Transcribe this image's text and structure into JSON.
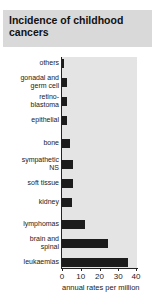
{
  "chart_data": {
    "type": "bar",
    "orientation": "horizontal",
    "title": "Incidence of childhood cancers",
    "xlabel": "annual rates per million",
    "ylabel": "",
    "xlim": [
      0,
      40
    ],
    "xticks": [
      "0",
      "10",
      "20",
      "30",
      "40"
    ],
    "grid": false,
    "legend": null,
    "categories": [
      "others",
      "gonadal and germ cell",
      "retino-blastoma",
      "epithelial",
      "bone",
      "sympathetic NS",
      "soft tissue",
      "kidney",
      "lymphomas",
      "brain and spinal",
      "leukaemias"
    ],
    "category_display": [
      "others",
      "gonadal and\ngerm cell",
      "retino-\nblastoma",
      "epithelial",
      "bone",
      "sympathetic\nNS",
      "soft tissue",
      "kidney",
      "lymphomas",
      "brain and\nspinal",
      "leukaemias"
    ],
    "values": [
      1,
      2.5,
      2.5,
      2.5,
      4.5,
      5.8,
      5.8,
      5.5,
      12,
      24.5,
      35
    ]
  },
  "colors": {
    "bar": "#1c1c1c",
    "plot_background": "#e4e4e4",
    "title_background": "#d9d9d9"
  }
}
